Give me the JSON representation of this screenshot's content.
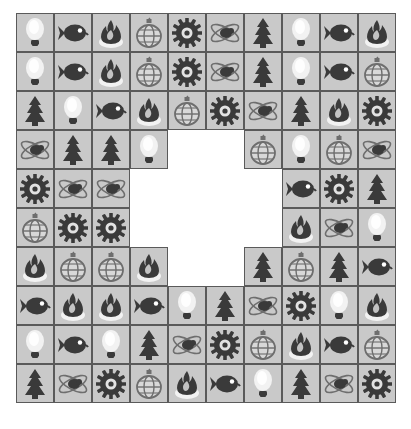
{
  "board": {
    "title": "match-three tile board",
    "rows": 10,
    "cols": 10,
    "cell_width": 38,
    "cell_height": 39,
    "origin_x": 16,
    "origin_y": 13,
    "colors": {
      "background": "#ffffff",
      "cell_fill": "#c9c9c9",
      "cell_border": "#5a5a5a",
      "dark_icon": "#3a3a3a",
      "mid_icon": "#6e6e6e",
      "glow": "#f2f2f2"
    },
    "icon_names": {
      "bulb": "lightbulb-icon",
      "fish": "fish-icon",
      "fire": "fire-icon",
      "orb": "ornament-icon",
      "gear": "gear-icon",
      "bee": "bee-icon",
      "tree": "tree-icon",
      "empty": "empty-cell"
    },
    "grid": [
      [
        "bulb",
        "fish",
        "fire",
        "orb",
        "gear",
        "bee",
        "tree",
        "bulb",
        "fish",
        "fire"
      ],
      [
        "bulb",
        "fish",
        "fire",
        "orb",
        "gear",
        "bee",
        "tree",
        "bulb",
        "fish",
        "orb"
      ],
      [
        "tree",
        "bulb",
        "fish",
        "fire",
        "orb",
        "gear",
        "bee",
        "tree",
        "fire",
        "gear"
      ],
      [
        "bee",
        "tree",
        "tree",
        "bulb",
        "empty",
        "empty",
        "orb",
        "bulb",
        "orb",
        "bee"
      ],
      [
        "gear",
        "bee",
        "bee",
        "empty",
        "empty",
        "empty",
        "empty",
        "fish",
        "gear",
        "tree"
      ],
      [
        "orb",
        "gear",
        "gear",
        "empty",
        "empty",
        "empty",
        "empty",
        "fire",
        "bee",
        "bulb"
      ],
      [
        "fire",
        "orb",
        "orb",
        "fire",
        "empty",
        "empty",
        "tree",
        "orb",
        "tree",
        "fish"
      ],
      [
        "fish",
        "fire",
        "fire",
        "fish",
        "bulb",
        "tree",
        "bee",
        "gear",
        "bulb",
        "fire"
      ],
      [
        "bulb",
        "fish",
        "bulb",
        "tree",
        "bee",
        "gear",
        "orb",
        "fire",
        "fish",
        "orb"
      ],
      [
        "tree",
        "bee",
        "gear",
        "orb",
        "fire",
        "fish",
        "bulb",
        "tree",
        "bee",
        "gear"
      ]
    ]
  }
}
